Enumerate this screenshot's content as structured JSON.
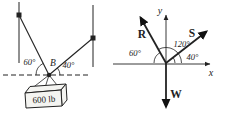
{
  "colors": {
    "ink": "#222222",
    "background": "#ffffff",
    "crate_fill": "#f4f4f1"
  },
  "load_diagram": {
    "angle_left_label": "60°",
    "point_label": "B",
    "angle_right_label": "40°",
    "weight_label": "600 lb"
  },
  "force_diagram": {
    "y_axis_label": "y",
    "x_axis_label": "x",
    "vector_r_label": "R",
    "vector_s_label": "S",
    "vector_w_label": "W",
    "angle_60_label": "60°",
    "angle_120_label": "120°",
    "angle_40_label": "40°"
  }
}
